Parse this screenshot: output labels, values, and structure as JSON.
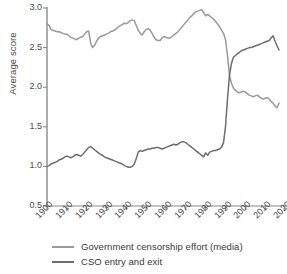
{
  "chart_data": {
    "type": "line",
    "title": "",
    "subtitle": "",
    "xlabel": "",
    "ylabel": "Average score",
    "xlim": [
      1900,
      2020
    ],
    "ylim": [
      0.5,
      3.0
    ],
    "grid": false,
    "legend_position": "bottom",
    "yticks": [
      "3.0",
      "2.5",
      "2.0",
      "1.5",
      "1.0",
      "0.5"
    ],
    "ytick_values": [
      3.0,
      2.5,
      2.0,
      1.5,
      1.0,
      0.5
    ],
    "xticks": [
      "1900",
      "1910",
      "1920",
      "1930",
      "1940",
      "1950",
      "1960",
      "1970",
      "1980",
      "1990",
      "2000",
      "2010",
      "2020"
    ],
    "xtick_values": [
      1900,
      1910,
      1920,
      1930,
      1940,
      1950,
      1960,
      1970,
      1980,
      1990,
      2000,
      2010,
      2020
    ],
    "colors": {
      "censorship": "#9a9a9a",
      "cso": "#6e6e6e",
      "axis": "#8a8a8a",
      "text": "#3a3a3a"
    },
    "annotations": [
      "Lines cross near 1992 at an average score of about 2.1"
    ],
    "series": [
      {
        "name": "Government censorship effort (media)",
        "color": "#9a9a9a",
        "x": [
          1900,
          1901,
          1902,
          1903,
          1904,
          1905,
          1906,
          1907,
          1908,
          1909,
          1910,
          1911,
          1912,
          1913,
          1914,
          1915,
          1916,
          1917,
          1918,
          1919,
          1920,
          1921,
          1922,
          1923,
          1924,
          1925,
          1926,
          1927,
          1928,
          1929,
          1930,
          1931,
          1932,
          1933,
          1934,
          1935,
          1936,
          1937,
          1938,
          1939,
          1940,
          1941,
          1942,
          1943,
          1944,
          1945,
          1946,
          1947,
          1948,
          1949,
          1950,
          1951,
          1952,
          1953,
          1954,
          1955,
          1956,
          1957,
          1958,
          1959,
          1960,
          1961,
          1962,
          1963,
          1964,
          1965,
          1966,
          1967,
          1968,
          1969,
          1970,
          1971,
          1972,
          1973,
          1974,
          1975,
          1976,
          1977,
          1978,
          1979,
          1980,
          1981,
          1982,
          1983,
          1984,
          1985,
          1986,
          1987,
          1988,
          1989,
          1990,
          1991,
          1992,
          1993,
          1994,
          1995,
          1996,
          1997,
          1998,
          1999,
          2000,
          2001,
          2002,
          2003,
          2004,
          2005,
          2006,
          2007,
          2008,
          2009,
          2010,
          2011,
          2012,
          2013,
          2014,
          2015,
          2016,
          2017
        ],
        "values": [
          2.8,
          2.78,
          2.73,
          2.72,
          2.71,
          2.7,
          2.7,
          2.69,
          2.68,
          2.67,
          2.67,
          2.65,
          2.63,
          2.62,
          2.61,
          2.6,
          2.62,
          2.63,
          2.64,
          2.67,
          2.7,
          2.71,
          2.56,
          2.5,
          2.53,
          2.58,
          2.62,
          2.64,
          2.65,
          2.66,
          2.67,
          2.68,
          2.7,
          2.71,
          2.72,
          2.74,
          2.76,
          2.78,
          2.79,
          2.81,
          2.8,
          2.82,
          2.84,
          2.85,
          2.84,
          2.78,
          2.72,
          2.68,
          2.66,
          2.7,
          2.73,
          2.74,
          2.72,
          2.68,
          2.63,
          2.6,
          2.59,
          2.59,
          2.62,
          2.64,
          2.63,
          2.62,
          2.62,
          2.64,
          2.66,
          2.68,
          2.7,
          2.73,
          2.76,
          2.79,
          2.82,
          2.85,
          2.88,
          2.9,
          2.93,
          2.95,
          2.96,
          2.97,
          2.98,
          2.94,
          2.9,
          2.92,
          2.9,
          2.88,
          2.86,
          2.83,
          2.8,
          2.76,
          2.72,
          2.68,
          2.6,
          2.4,
          2.15,
          2.05,
          1.99,
          1.96,
          1.94,
          1.93,
          1.94,
          1.95,
          1.94,
          1.92,
          1.9,
          1.89,
          1.88,
          1.89,
          1.9,
          1.88,
          1.86,
          1.85,
          1.86,
          1.87,
          1.85,
          1.82,
          1.8,
          1.76,
          1.74,
          1.8
        ],
        "start_value": 2.8,
        "end_value": 1.8,
        "peak_value": 2.98,
        "peak_year": 1978,
        "min_value": 1.74,
        "min_year": 2016
      },
      {
        "name": "CSO entry and exit",
        "color": "#6e6e6e",
        "x": [
          1900,
          1901,
          1902,
          1903,
          1904,
          1905,
          1906,
          1907,
          1908,
          1909,
          1910,
          1911,
          1912,
          1913,
          1914,
          1915,
          1916,
          1917,
          1918,
          1919,
          1920,
          1921,
          1922,
          1923,
          1924,
          1925,
          1926,
          1927,
          1928,
          1929,
          1930,
          1931,
          1932,
          1933,
          1934,
          1935,
          1936,
          1937,
          1938,
          1939,
          1940,
          1941,
          1942,
          1943,
          1944,
          1945,
          1946,
          1947,
          1948,
          1949,
          1950,
          1951,
          1952,
          1953,
          1954,
          1955,
          1956,
          1957,
          1958,
          1959,
          1960,
          1961,
          1962,
          1963,
          1964,
          1965,
          1966,
          1967,
          1968,
          1969,
          1970,
          1971,
          1972,
          1973,
          1974,
          1975,
          1976,
          1977,
          1978,
          1979,
          1980,
          1981,
          1982,
          1983,
          1984,
          1985,
          1986,
          1987,
          1988,
          1989,
          1990,
          1991,
          1992,
          1993,
          1994,
          1995,
          1996,
          1997,
          1998,
          1999,
          2000,
          2001,
          2002,
          2003,
          2004,
          2005,
          2006,
          2007,
          2008,
          2009,
          2010,
          2011,
          2012,
          2013,
          2014,
          2015,
          2016,
          2017
        ],
        "values": [
          1.0,
          1.01,
          1.03,
          1.04,
          1.05,
          1.06,
          1.08,
          1.09,
          1.1,
          1.12,
          1.13,
          1.12,
          1.11,
          1.12,
          1.14,
          1.15,
          1.14,
          1.13,
          1.15,
          1.18,
          1.21,
          1.24,
          1.25,
          1.23,
          1.21,
          1.19,
          1.17,
          1.15,
          1.14,
          1.12,
          1.11,
          1.1,
          1.09,
          1.08,
          1.07,
          1.06,
          1.05,
          1.04,
          1.03,
          1.01,
          1.0,
          0.99,
          0.99,
          1.0,
          1.03,
          1.1,
          1.18,
          1.2,
          1.19,
          1.2,
          1.21,
          1.22,
          1.22,
          1.23,
          1.23,
          1.24,
          1.24,
          1.23,
          1.22,
          1.23,
          1.24,
          1.25,
          1.26,
          1.27,
          1.28,
          1.27,
          1.28,
          1.3,
          1.31,
          1.31,
          1.3,
          1.28,
          1.26,
          1.24,
          1.22,
          1.2,
          1.18,
          1.16,
          1.14,
          1.12,
          1.17,
          1.14,
          1.18,
          1.19,
          1.2,
          1.2,
          1.21,
          1.22,
          1.24,
          1.3,
          1.5,
          1.85,
          2.15,
          2.3,
          2.38,
          2.4,
          2.42,
          2.44,
          2.46,
          2.47,
          2.48,
          2.49,
          2.5,
          2.5,
          2.51,
          2.52,
          2.53,
          2.54,
          2.55,
          2.56,
          2.57,
          2.58,
          2.59,
          2.62,
          2.65,
          2.58,
          2.52,
          2.47
        ],
        "start_value": 1.0,
        "end_value": 2.47,
        "peak_value": 2.65,
        "peak_year": 2014,
        "min_value": 0.99,
        "min_year": 1941
      }
    ],
    "legend": [
      {
        "label": "Government censorship effort (media)",
        "color": "#9a9a9a"
      },
      {
        "label": "CSO entry and exit",
        "color": "#6e6e6e"
      }
    ]
  }
}
